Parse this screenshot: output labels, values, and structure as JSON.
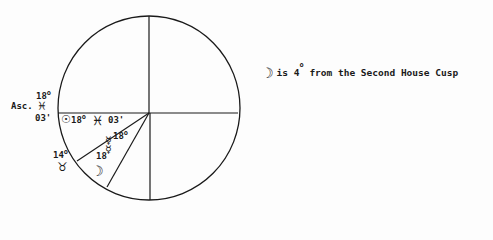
{
  "chart": {
    "type": "astrological-house-wheel",
    "center": [
      149,
      113
    ],
    "radius": 90,
    "house_lines": [
      {
        "from": [
          149,
          113
        ],
        "to": [
          149,
          16
        ],
        "name": "mc-line"
      },
      {
        "from": [
          149,
          113
        ],
        "to": [
          149,
          200
        ],
        "name": "ic-line"
      },
      {
        "from": [
          57,
          113
        ],
        "to": [
          238,
          113
        ],
        "name": "horizon-line"
      },
      {
        "from": [
          149,
          113
        ],
        "to": [
          77,
          161
        ],
        "name": "second-house-cusp"
      },
      {
        "from": [
          149,
          113
        ],
        "to": [
          107,
          186
        ],
        "name": "third-house-cusp"
      }
    ],
    "stroke_color": "#1a1a1a"
  },
  "labels": {
    "asc_label": "Asc.",
    "asc_degree": "18",
    "asc_sign_symbol": "♓",
    "asc_minutes": "03'",
    "sun_symbol": "☉",
    "sun_degree": "18",
    "sun_sign_symbol": "♓",
    "sun_minutes": "03'",
    "mercury_degree_upper": "18",
    "mercury_symbol_upper": "☿",
    "mercury_symbol_lower": "☿",
    "mercury_degree_lower": "18",
    "taurus_degree": "14",
    "taurus_symbol": "♉",
    "moon_symbol": "☽",
    "degree_mark": "o"
  },
  "note": {
    "moon_symbol": "☽",
    "text_before": "is 4",
    "degree_mark": "o",
    "text_after": " from the Second House Cusp"
  }
}
